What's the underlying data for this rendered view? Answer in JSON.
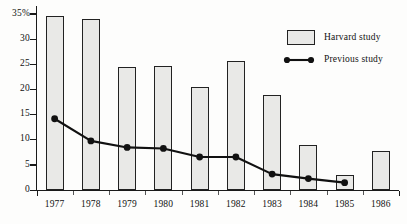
{
  "chart_data": {
    "type": "bar",
    "title": "",
    "subtitle": "",
    "xlabel": "",
    "ylabel": "",
    "categories": [
      "1977",
      "1978",
      "1979",
      "1980",
      "1981",
      "1982",
      "1983",
      "1984",
      "1985",
      "1986"
    ],
    "series": [
      {
        "name": "Harvard study",
        "type": "bar",
        "values": [
          34.6,
          34.0,
          24.4,
          24.7,
          20.6,
          25.6,
          19.0,
          9.0,
          3.0,
          7.7
        ]
      },
      {
        "name": "Previous study",
        "type": "line",
        "values": [
          14.2,
          9.8,
          8.5,
          8.3,
          6.6,
          6.6,
          3.2,
          2.3,
          1.5,
          null
        ]
      }
    ],
    "ylim": [
      0,
      36.5
    ],
    "yticks": [
      0,
      5,
      10,
      15,
      20,
      25,
      30,
      35
    ],
    "ytick_labels": [
      "0",
      "5",
      "10",
      "15",
      "20",
      "25",
      "30",
      "35%"
    ],
    "grid": false,
    "legend_position": "top-right"
  },
  "legend": {
    "items": [
      {
        "label": "Harvard study",
        "marker": "bar-swatch"
      },
      {
        "label": "Previous study",
        "marker": "line-dot"
      }
    ]
  },
  "colors": {
    "bar_fill": "#e9e9e7",
    "bar_stroke": "#222222",
    "line": "#111111",
    "axis": "#1a1a1a",
    "background": "#fdfdfc",
    "text": "#111111"
  }
}
